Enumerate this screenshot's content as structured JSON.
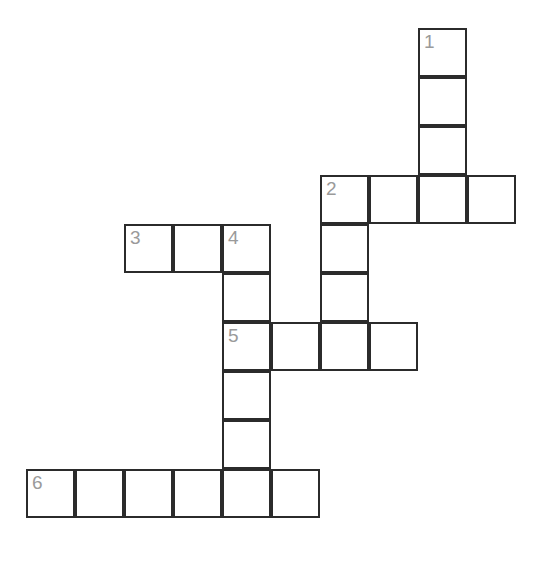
{
  "puzzle": {
    "type": "crossword-grid",
    "background_color": "#ffffff",
    "cell_fill_color": "#ffffff",
    "cell_border_color": "#2b2b2b",
    "number_color": "#9a9a9a",
    "cell_size_px": 49,
    "origin": {
      "x": 26,
      "y": 28
    },
    "columns": 10,
    "rows": 10,
    "numbered_clues": [
      {
        "number": "1",
        "col": 8,
        "row": 0,
        "direction": "down",
        "length": 4
      },
      {
        "number": "2",
        "col": 6,
        "row": 3,
        "direction": "across-and-down",
        "across_length": 4,
        "down_length": 4
      },
      {
        "number": "3",
        "col": 2,
        "row": 4,
        "direction": "across",
        "length": 3
      },
      {
        "number": "4",
        "col": 4,
        "row": 4,
        "direction": "down",
        "length": 6
      },
      {
        "number": "5",
        "col": 4,
        "row": 6,
        "direction": "across",
        "length": 4
      },
      {
        "number": "6",
        "col": 0,
        "row": 9,
        "direction": "across",
        "length": 6
      }
    ],
    "cells": [
      {
        "col": 8,
        "row": 0,
        "number": "1",
        "letter": ""
      },
      {
        "col": 8,
        "row": 1,
        "number": "",
        "letter": ""
      },
      {
        "col": 8,
        "row": 2,
        "number": "",
        "letter": ""
      },
      {
        "col": 6,
        "row": 3,
        "number": "2",
        "letter": ""
      },
      {
        "col": 7,
        "row": 3,
        "number": "",
        "letter": ""
      },
      {
        "col": 8,
        "row": 3,
        "number": "",
        "letter": ""
      },
      {
        "col": 9,
        "row": 3,
        "number": "",
        "letter": ""
      },
      {
        "col": 2,
        "row": 4,
        "number": "3",
        "letter": ""
      },
      {
        "col": 3,
        "row": 4,
        "number": "",
        "letter": ""
      },
      {
        "col": 4,
        "row": 4,
        "number": "4",
        "letter": ""
      },
      {
        "col": 6,
        "row": 4,
        "number": "",
        "letter": ""
      },
      {
        "col": 4,
        "row": 5,
        "number": "",
        "letter": ""
      },
      {
        "col": 6,
        "row": 5,
        "number": "",
        "letter": ""
      },
      {
        "col": 4,
        "row": 6,
        "number": "5",
        "letter": ""
      },
      {
        "col": 5,
        "row": 6,
        "number": "",
        "letter": ""
      },
      {
        "col": 6,
        "row": 6,
        "number": "",
        "letter": ""
      },
      {
        "col": 7,
        "row": 6,
        "number": "",
        "letter": ""
      },
      {
        "col": 4,
        "row": 7,
        "number": "",
        "letter": ""
      },
      {
        "col": 4,
        "row": 8,
        "number": "",
        "letter": ""
      },
      {
        "col": 0,
        "row": 9,
        "number": "6",
        "letter": ""
      },
      {
        "col": 1,
        "row": 9,
        "number": "",
        "letter": ""
      },
      {
        "col": 2,
        "row": 9,
        "number": "",
        "letter": ""
      },
      {
        "col": 3,
        "row": 9,
        "number": "",
        "letter": ""
      },
      {
        "col": 4,
        "row": 9,
        "number": "",
        "letter": ""
      },
      {
        "col": 5,
        "row": 9,
        "number": "",
        "letter": ""
      }
    ]
  }
}
